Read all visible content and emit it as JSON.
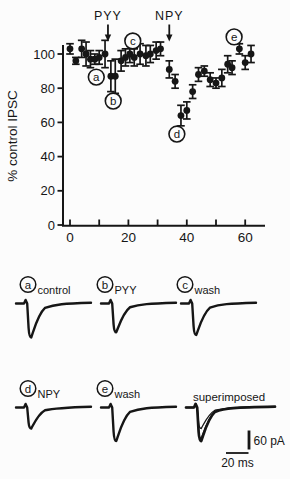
{
  "figure": {
    "background": "#fcfcfc",
    "ink": "#161616"
  },
  "chart_data": {
    "type": "scatter",
    "title": "",
    "xlabel": "",
    "ylabel": "% control IPSC",
    "xlim": [
      -2.5,
      66
    ],
    "ylim": [
      0,
      112
    ],
    "grid": false,
    "x_ticks": [
      0,
      10,
      20,
      30,
      40,
      50,
      60
    ],
    "x_labeled_ticks": [
      0,
      20,
      40,
      60
    ],
    "y_ticks": [
      0,
      20,
      40,
      60,
      80,
      100
    ],
    "series": [
      {
        "name": "IPSC amplitude (% of control, mean with error bars)",
        "marker": "filled-circle",
        "points": [
          {
            "x": 0,
            "y": 103,
            "err": 3
          },
          {
            "x": 2,
            "y": 96,
            "err": 2
          },
          {
            "x": 4,
            "y": 103,
            "err": 5
          },
          {
            "x": 5.5,
            "y": 100,
            "err": 7
          },
          {
            "x": 7,
            "y": 97,
            "err": 5
          },
          {
            "x": 8.5,
            "y": 97,
            "err": 3
          },
          {
            "x": 10,
            "y": 98,
            "err": 4
          },
          {
            "x": 12,
            "y": 100,
            "err": 8
          },
          {
            "x": 14,
            "y": 87,
            "err": 9
          },
          {
            "x": 15.5,
            "y": 87,
            "err": 10
          },
          {
            "x": 17.5,
            "y": 96,
            "err": 6
          },
          {
            "x": 19,
            "y": 98,
            "err": 5
          },
          {
            "x": 20.5,
            "y": 100,
            "err": 5
          },
          {
            "x": 22,
            "y": 98,
            "err": 5
          },
          {
            "x": 24,
            "y": 100,
            "err": 6
          },
          {
            "x": 26,
            "y": 99,
            "err": 6
          },
          {
            "x": 27.5,
            "y": 100,
            "err": 5
          },
          {
            "x": 29.5,
            "y": 102,
            "err": 5
          },
          {
            "x": 31,
            "y": 103,
            "err": 4
          },
          {
            "x": 34,
            "y": 91,
            "err": 5
          },
          {
            "x": 36,
            "y": 84,
            "err": 4
          },
          {
            "x": 38,
            "y": 64,
            "err": 6
          },
          {
            "x": 40,
            "y": 67,
            "err": 5
          },
          {
            "x": 42,
            "y": 78,
            "err": 4
          },
          {
            "x": 44,
            "y": 88,
            "err": 4
          },
          {
            "x": 46,
            "y": 90,
            "err": 3
          },
          {
            "x": 48,
            "y": 85,
            "err": 4
          },
          {
            "x": 50,
            "y": 83,
            "err": 3
          },
          {
            "x": 52,
            "y": 86,
            "err": 5
          },
          {
            "x": 54,
            "y": 94,
            "err": 5
          },
          {
            "x": 55.5,
            "y": 92,
            "err": 4
          },
          {
            "x": 58,
            "y": 103,
            "err": 3
          },
          {
            "x": 60,
            "y": 95,
            "err": 4
          },
          {
            "x": 62,
            "y": 100,
            "err": 5
          }
        ]
      }
    ],
    "annotations": {
      "arrows": [
        {
          "label": "PYY",
          "x": 13
        },
        {
          "label": "NPY",
          "x": 34
        }
      ],
      "circled_letters": [
        {
          "letter": "a",
          "cx": 9,
          "cy": 86.5,
          "tx": 10,
          "ty": 93
        },
        {
          "letter": "b",
          "cx": 14.8,
          "cy": 72.5,
          "tx": 15.5,
          "ty": 78.5
        },
        {
          "letter": "c",
          "cx": 21.5,
          "cy": 107.6,
          "tx": 20.5,
          "ty": 103
        },
        {
          "letter": "d",
          "cx": 36.6,
          "cy": 53.2,
          "tx": 38,
          "ty": 59.5
        },
        {
          "letter": "e",
          "cx": 56.2,
          "cy": 110,
          "tx": 58,
          "ty": 104.5
        }
      ]
    }
  },
  "traces": {
    "panels": [
      {
        "letter": "a",
        "label": "control",
        "rel_amp": 1.0,
        "row": 0,
        "col": 0
      },
      {
        "letter": "b",
        "label": "PYY",
        "rel_amp": 0.85,
        "row": 0,
        "col": 1
      },
      {
        "letter": "c",
        "label": "wash",
        "rel_amp": 0.93,
        "row": 0,
        "col": 2
      },
      {
        "letter": "d",
        "label": "NPY",
        "rel_amp": 0.62,
        "row": 1,
        "col": 0
      },
      {
        "letter": "e",
        "label": "wash",
        "rel_amp": 0.99,
        "row": 1,
        "col": 1
      }
    ],
    "superimposed": {
      "label": "superimposed",
      "rel_amps": [
        0.99,
        0.91,
        0.62
      ],
      "row": 1,
      "col": 2
    },
    "scale_bars": {
      "vertical_label": "60 pA",
      "horizontal_label": "20 ms"
    }
  }
}
